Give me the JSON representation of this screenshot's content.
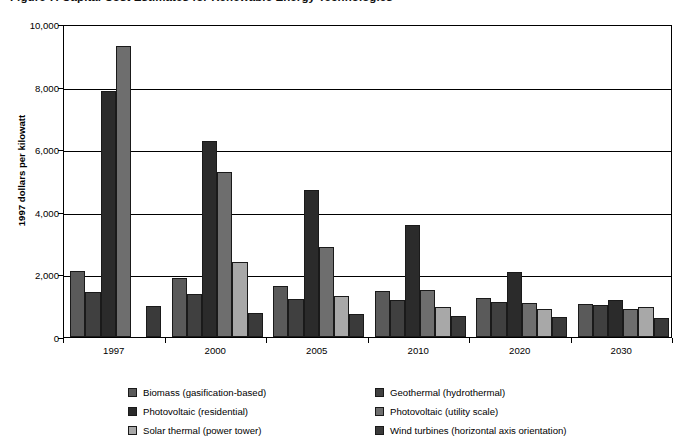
{
  "chart_data": {
    "type": "bar",
    "title": "Figure 7. Capital Cost Estimates for Renewable Energy Technologies",
    "xlabel": "",
    "ylabel": "1997 dollars per kilowatt",
    "ylim": [
      0,
      10000
    ],
    "ytick_labels": [
      "0",
      "2,000",
      "4,000",
      "6,000",
      "8,000",
      "10,000"
    ],
    "ytick_values": [
      0,
      2000,
      4000,
      6000,
      8000,
      10000
    ],
    "grid": true,
    "legend_position": "bottom",
    "categories": [
      "1997",
      "2000",
      "2005",
      "2010",
      "2020",
      "2030"
    ],
    "series": [
      {
        "name": "Biomass (gasification-based)",
        "color": "#5a5a5a",
        "values": [
          2100,
          1880,
          1640,
          1470,
          1250,
          1060
        ]
      },
      {
        "name": "Geothermal (hydrothermal)",
        "color": "#404040",
        "values": [
          1450,
          1370,
          1220,
          1170,
          1110,
          1010
        ]
      },
      {
        "name": "Photovoltaic (residential)",
        "color": "#2b2b2b",
        "values": [
          7850,
          6250,
          4700,
          3580,
          2080,
          1170
        ]
      },
      {
        "name": "Photovoltaic (utility scale)",
        "color": "#6e6e6e",
        "values": [
          9300,
          5270,
          2870,
          1500,
          1080,
          880
        ]
      },
      {
        "name": "Solar thermal (power tower)",
        "color": "#a8a8a8",
        "values": [
          null,
          2400,
          1300,
          970,
          880,
          950
        ]
      },
      {
        "name": "Wind turbines (horizontal axis orientation)",
        "color": "#3a3a3a",
        "values": [
          1000,
          760,
          720,
          670,
          640,
          610
        ]
      }
    ]
  }
}
